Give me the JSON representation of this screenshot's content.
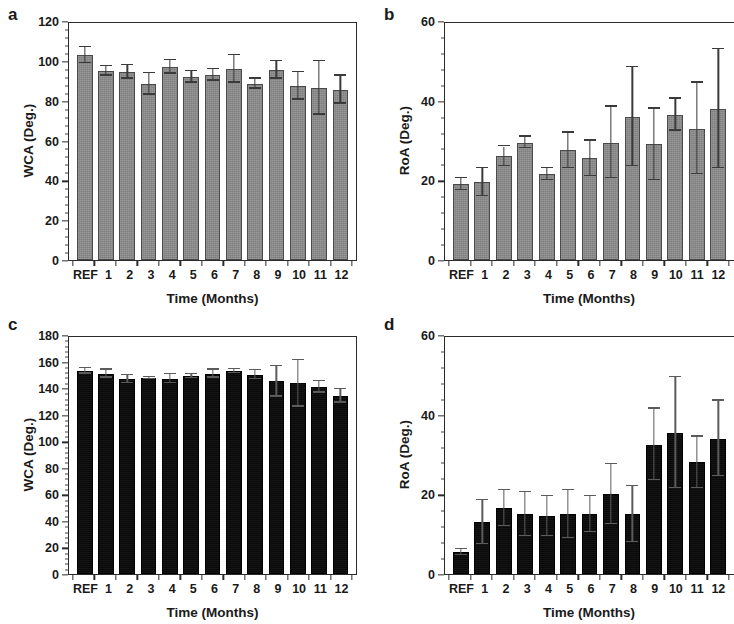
{
  "figure": {
    "background": "#ffffff",
    "gray_bar_color": "#8b8b8b",
    "black_bar_color": "#0c0c0c",
    "axis_color": "#2b2b2b"
  },
  "panels": [
    {
      "letter": "a",
      "chart_data": {
        "type": "bar",
        "title": "",
        "xlabel": "Time (Months)",
        "ylabel": "WCA (Deg.)",
        "ylim": [
          0,
          120
        ],
        "yticks": [
          0,
          20,
          40,
          60,
          80,
          100,
          120
        ],
        "ytick_labels": [
          "0",
          "20",
          "40",
          "60",
          "80",
          "100",
          "120"
        ],
        "minor_ticks_per_interval": 4,
        "grid": false,
        "legend": null,
        "bar_color": "#8b8b8b",
        "categories": [
          "REF",
          "1",
          "2",
          "3",
          "4",
          "5",
          "6",
          "7",
          "8",
          "9",
          "10",
          "11",
          "12"
        ],
        "values": [
          103.0,
          95.0,
          94.5,
          88.5,
          97.0,
          92.0,
          93.0,
          96.0,
          88.5,
          95.5,
          87.5,
          86.5,
          85.5
        ],
        "errors": [
          4.0,
          2.5,
          3.5,
          5.5,
          3.5,
          3.0,
          3.0,
          7.0,
          2.5,
          4.5,
          7.0,
          13.5,
          7.0
        ]
      }
    },
    {
      "letter": "b",
      "chart_data": {
        "type": "bar",
        "title": "",
        "xlabel": "Time (Months)",
        "ylabel": "RoA (Deg.)",
        "ylim": [
          0,
          60
        ],
        "yticks": [
          0,
          20,
          40,
          60
        ],
        "ytick_labels": [
          "0",
          "20",
          "40",
          "60"
        ],
        "minor_ticks_per_interval": 4,
        "grid": false,
        "legend": null,
        "bar_color": "#8b8b8b",
        "categories": [
          "REF",
          "1",
          "2",
          "3",
          "4",
          "5",
          "6",
          "7",
          "8",
          "9",
          "10",
          "11",
          "12"
        ],
        "values": [
          19.0,
          19.5,
          26.0,
          29.5,
          21.5,
          27.5,
          25.5,
          29.5,
          36.0,
          29.0,
          36.5,
          33.0,
          38.0
        ],
        "errors": [
          1.5,
          3.5,
          2.5,
          1.5,
          1.5,
          4.5,
          4.5,
          9.0,
          12.5,
          9.0,
          4.0,
          11.5,
          15.0
        ]
      }
    },
    {
      "letter": "c",
      "chart_data": {
        "type": "bar",
        "title": "",
        "xlabel": "Time (Months)",
        "ylabel": "WCA (Deg.)",
        "ylim": [
          0,
          180
        ],
        "yticks": [
          0,
          20,
          40,
          60,
          80,
          100,
          120,
          140,
          160,
          180
        ],
        "ytick_labels": [
          "0",
          "20",
          "40",
          "60",
          "80",
          "100",
          "120",
          "140",
          "160",
          "180"
        ],
        "minor_ticks_per_interval": 4,
        "grid": false,
        "legend": null,
        "bar_color": "#0c0c0c",
        "categories": [
          "REF",
          "1",
          "2",
          "3",
          "4",
          "5",
          "6",
          "7",
          "8",
          "9",
          "10",
          "11",
          "12"
        ],
        "values": [
          153.0,
          151.0,
          147.0,
          147.5,
          147.0,
          149.0,
          151.0,
          153.0,
          150.0,
          145.0,
          143.5,
          141.0,
          134.0
        ],
        "errors": [
          2.0,
          3.0,
          3.0,
          1.0,
          3.5,
          1.5,
          3.0,
          1.5,
          3.5,
          11.5,
          17.5,
          4.5,
          5.0
        ]
      }
    },
    {
      "letter": "d",
      "chart_data": {
        "type": "bar",
        "title": "",
        "xlabel": "Time (Months)",
        "ylabel": "RoA (Deg.)",
        "ylim": [
          0,
          60
        ],
        "yticks": [
          0,
          20,
          40,
          60
        ],
        "ytick_labels": [
          "0",
          "20",
          "40",
          "60"
        ],
        "minor_ticks_per_interval": 4,
        "grid": false,
        "legend": null,
        "bar_color": "#0c0c0c",
        "categories": [
          "REF",
          "1",
          "2",
          "3",
          "4",
          "5",
          "6",
          "7",
          "8",
          "9",
          "10",
          "11",
          "12"
        ],
        "values": [
          5.5,
          13.0,
          16.5,
          15.0,
          14.5,
          15.0,
          15.0,
          20.0,
          15.0,
          32.5,
          35.5,
          28.0,
          34.0
        ],
        "errors": [
          0.7,
          5.5,
          4.5,
          5.5,
          5.0,
          6.0,
          4.5,
          7.5,
          7.0,
          9.0,
          14.0,
          6.5,
          9.5
        ]
      }
    }
  ]
}
